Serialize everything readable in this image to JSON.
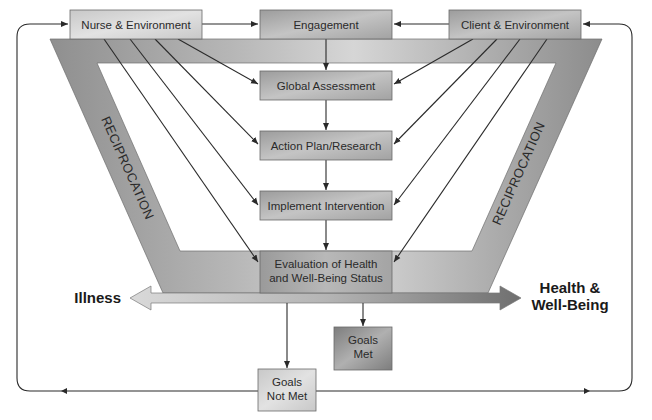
{
  "diagram": {
    "type": "nursing-process-model",
    "top_row": {
      "left": "Nurse & Environment",
      "center": "Engagement",
      "right": "Client & Environment"
    },
    "process_steps": [
      "Global Assessment",
      "Action Plan/Research",
      "Implement Intervention"
    ],
    "evaluation": {
      "line1": "Evaluation of Health",
      "line2": "and Well-Being Status"
    },
    "band_labels": {
      "left": "RECIPROCATION",
      "right": "RECIPROCATION"
    },
    "continuum": {
      "left_label": "Illness",
      "right_label_line1": "Health &",
      "right_label_line2": "Well-Being"
    },
    "outcomes": {
      "goals_met": {
        "line1": "Goals",
        "line2": "Met"
      },
      "goals_not_met": {
        "line1": "Goals",
        "line2": "Not Met"
      }
    },
    "colors": {
      "band_dark": "#8e8e8e",
      "band_light": "#cfcfcf",
      "box_mid": "#a9a9a9",
      "box_light": "#d2d2d2",
      "line": "#2a2a2a"
    }
  }
}
